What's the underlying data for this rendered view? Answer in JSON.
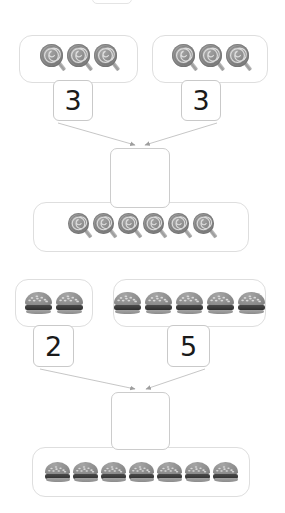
{
  "page": {
    "kind": "math-addition-worksheet",
    "background_color": "#ffffff",
    "box_border_color": "#dedede",
    "number_box_border_color": "#c9c9c9",
    "arrow_color": "#b0b0b0",
    "digit_color": "#1a1a1a",
    "icon_color": "#8e8e8e"
  },
  "top_partial_element": {
    "name": "cropped-box-above",
    "visible_label": ""
  },
  "problems": [
    {
      "id": "problem-lollipops",
      "item_icon": "lollipop-icon",
      "addends": [
        {
          "label": "3",
          "count": 3
        },
        {
          "label": "3",
          "count": 3
        }
      ],
      "answer_box": {
        "label": "",
        "placeholder": ""
      },
      "result_group": {
        "count": 6
      }
    },
    {
      "id": "problem-hamburgers",
      "item_icon": "hamburger-icon",
      "addends": [
        {
          "label": "2",
          "count": 2
        },
        {
          "label": "5",
          "count": 5
        }
      ],
      "answer_box": {
        "label": "",
        "placeholder": ""
      },
      "result_group": {
        "count": 7
      }
    }
  ]
}
